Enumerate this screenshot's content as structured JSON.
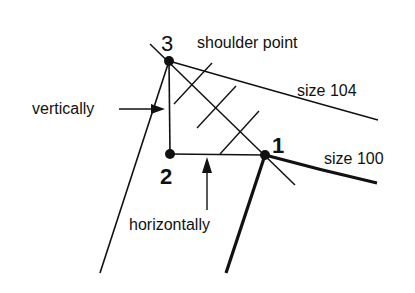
{
  "diagram": {
    "labels": {
      "point3": "3",
      "point2": "2",
      "point1": "1",
      "shoulder": "shoulder point",
      "size104": "size 104",
      "size100": "size 100",
      "vertically": "vertically",
      "horizontally": "horizontally"
    },
    "colors": {
      "ink": "#111111",
      "background": "#ffffff"
    }
  }
}
